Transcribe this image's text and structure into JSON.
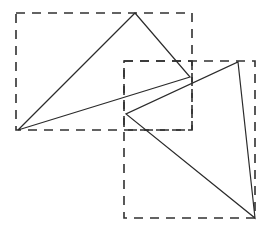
{
  "figure": {
    "canvas": {
      "width": 271,
      "height": 232,
      "background": "#ffffff"
    },
    "stroke_colors": {
      "solid": "#2b2b2b",
      "dashed": "#303030"
    },
    "dash_pattern": "9 7",
    "shapes": [
      {
        "id": "triangle-upper-left",
        "name": "triangle-1",
        "type": "polygon",
        "stroke": "#2b2b2b",
        "fill": "none",
        "points": [
          [
            135,
            13
          ],
          [
            190,
            77
          ],
          [
            18,
            130
          ]
        ],
        "points_str": "135,13 190,77 18,130"
      },
      {
        "id": "triangle-lower-right",
        "name": "triangle-2",
        "type": "polygon",
        "stroke": "#2b2b2b",
        "fill": "none",
        "points": [
          [
            238,
            62
          ],
          [
            255,
            218
          ],
          [
            126,
            114
          ]
        ],
        "points_str": "238,62 255,218 126,114"
      }
    ],
    "bounding_boxes": [
      {
        "id": "bbox-left",
        "name": "dashed-box-left",
        "type": "rect",
        "x": 16,
        "y": 13,
        "width": 176,
        "height": 117,
        "stroke": "#303030",
        "fill": "none"
      },
      {
        "id": "bbox-middle",
        "name": "dashed-box-middle",
        "type": "rect",
        "x": 124,
        "y": 61,
        "width": 68,
        "height": 69,
        "stroke": "#303030",
        "fill": "none"
      },
      {
        "id": "bbox-right",
        "name": "dashed-box-right",
        "type": "rect",
        "x": 124,
        "y": 61,
        "width": 131,
        "height": 157,
        "stroke": "#303030",
        "fill": "none"
      }
    ]
  }
}
